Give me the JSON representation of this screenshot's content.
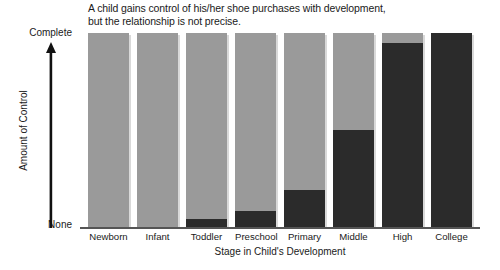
{
  "chart_data": {
    "type": "bar",
    "title": "A child gains control of his/her shoe purchases with development, but the relationship is not precise.",
    "title_line1": "A child gains control of his/her shoe purchases with development,",
    "title_line2": "but the relationship is not precise.",
    "xlabel": "Stage in Child's Development",
    "ylabel": "Amount of Control",
    "categories": [
      "Newborn",
      "Infant",
      "Toddler",
      "Preschool",
      "Primary",
      "Middle",
      "High",
      "College"
    ],
    "values": [
      0,
      0,
      4,
      8,
      19,
      50,
      95,
      100
    ],
    "ylim": [
      0,
      100
    ],
    "ytick_labels": [
      "None",
      "Complete"
    ],
    "ytick_values": [
      0,
      100
    ],
    "grid": false,
    "legend": null,
    "series": [
      {
        "name": "Amount of control held by child",
        "values": [
          0,
          0,
          4,
          8,
          19,
          50,
          95,
          100
        ],
        "color": "#2b2b2b"
      },
      {
        "name": "Remaining control",
        "values": [
          100,
          100,
          96,
          92,
          81,
          50,
          5,
          0
        ],
        "color": "#9a9a9a"
      }
    ]
  },
  "axes": {
    "y_top_label": "Complete",
    "y_bottom_label": "None",
    "y_axis_title": "Amount of Control",
    "x_axis_title": "Stage in Child's Development"
  },
  "colors": {
    "bar_filled": "#2b2b2b",
    "bar_empty": "#9a9a9a",
    "axis": "#555555",
    "text": "#1a1a1a",
    "background": "#ffffff",
    "shadow": "#d9d9d9"
  }
}
